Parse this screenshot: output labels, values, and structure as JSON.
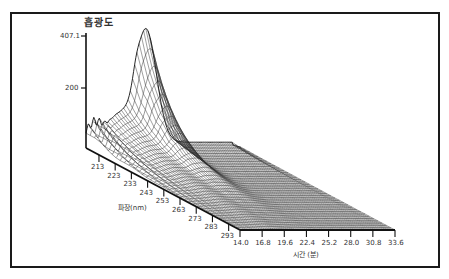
{
  "chart_data": {
    "type": "surface3d",
    "title": "흡광도",
    "zlabel": "흡광도",
    "ylabel": "파장(nm)",
    "xlabel": "시간 (분)",
    "z_ticks": [
      "407.1",
      "200"
    ],
    "z_range": [
      0,
      407.1
    ],
    "wavelength_ticks": [
      "213",
      "223",
      "233",
      "243",
      "253",
      "263",
      "273",
      "283",
      "293"
    ],
    "time_ticks": [
      "14.0",
      "16.8",
      "19.6",
      "22.4",
      "25.2",
      "28.0",
      "30.8",
      "33.6"
    ],
    "time_range": [
      14.0,
      33.6
    ],
    "wavelength_range": [
      205,
      300
    ],
    "peaks": [
      {
        "time": 21.5,
        "wavelength": 213,
        "absorbance": 400,
        "description": "main tall peak at low wavelength"
      },
      {
        "time": 18.0,
        "wavelength": 213,
        "absorbance": 90,
        "description": "broad hump"
      },
      {
        "time": 15.5,
        "wavelength": 215,
        "absorbance": 60,
        "description": "small noisy ridges near start"
      }
    ],
    "grid": false,
    "legend": null
  },
  "axes": {
    "z_title": "흡광도",
    "z_top": "407.1",
    "z_mid": "200",
    "wavelength_label": "파장(nm)",
    "time_label": "시간 (분)"
  }
}
